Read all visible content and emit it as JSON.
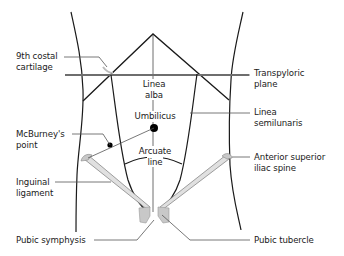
{
  "diagram": {
    "type": "anatomical-surface-landmarks",
    "colors": {
      "outline": "#1a1a1a",
      "plane": "#6e6e6e",
      "leader": "#555555",
      "ligament_fill": "#cfcfcf",
      "bone_fill": "#c8c8c8"
    },
    "labels": {
      "costal_cartilage_line1": "9th costal",
      "costal_cartilage_line2": "cartilage",
      "transpyloric_line1": "Transpyloric",
      "transpyloric_line2": "plane",
      "linea_alba_line1": "Linea",
      "linea_alba_line2": "alba",
      "umbilicus": "Umbilicus",
      "linea_semilunaris_line1": "Linea",
      "linea_semilunaris_line2": "semilunaris",
      "mcburney_line1": "McBurney's",
      "mcburney_line2": "point",
      "arcuate_line1": "Arcuate",
      "arcuate_line2": "line",
      "asis_line1": "Anterior superior",
      "asis_line2": "iliac spine",
      "inguinal_line1": "Inguinal",
      "inguinal_line2": "ligament",
      "pubic_symphysis": "Pubic symphysis",
      "pubic_tubercle": "Pubic tubercle"
    }
  }
}
